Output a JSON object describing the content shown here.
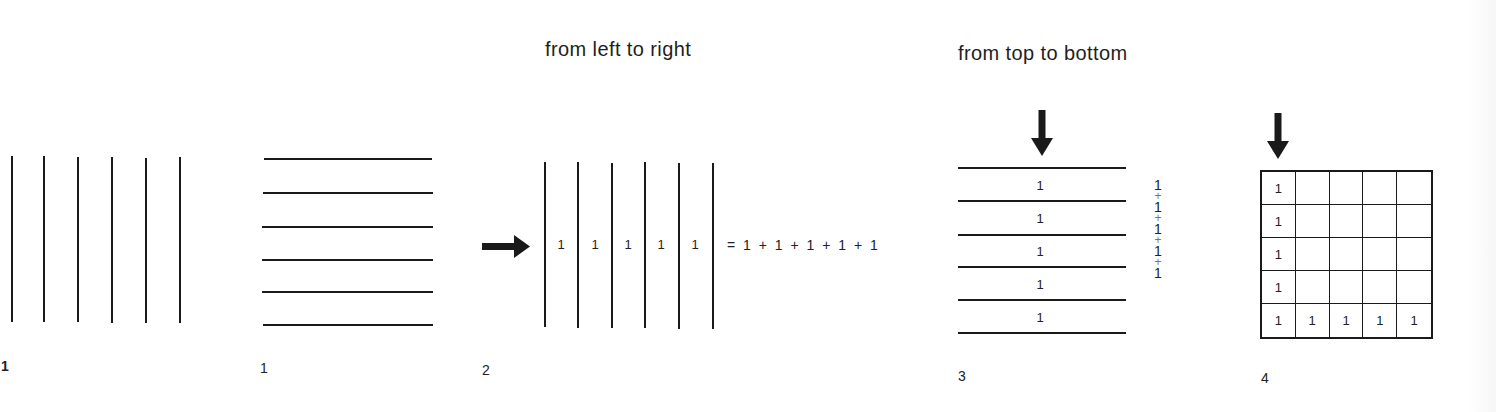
{
  "headings": {
    "left_to_right": "from left to right",
    "top_to_bottom": "from top to bottom"
  },
  "figures": [
    {
      "id": "fig1a",
      "label": "1",
      "kind": "vertical-lines",
      "line_count": 6
    },
    {
      "id": "fig1b",
      "label": "1",
      "kind": "horizontal-lines",
      "line_count": 6
    },
    {
      "id": "fig2",
      "label": "2",
      "kind": "vertical-strips-counted-left-to-right",
      "arrow": "right-arrow",
      "strip_values": [
        "1",
        "1",
        "1",
        "1",
        "1"
      ],
      "equation": "= 1 + 1 + 1 + 1 + 1"
    },
    {
      "id": "fig3",
      "label": "3",
      "kind": "horizontal-strips-counted-top-to-bottom",
      "arrow": "down-arrow",
      "strip_values": [
        "1",
        "1",
        "1",
        "1",
        "1"
      ],
      "side_sum": [
        "1",
        "+",
        "1",
        "+",
        "1",
        "+",
        "1",
        "+",
        "1"
      ]
    },
    {
      "id": "fig4",
      "label": "4",
      "kind": "grid-5x5",
      "arrow": "down-arrow",
      "rows": [
        [
          "1",
          "",
          "",
          "",
          ""
        ],
        [
          "1",
          "",
          "",
          "",
          ""
        ],
        [
          "1",
          "",
          "",
          "",
          ""
        ],
        [
          "1",
          "",
          "",
          "",
          ""
        ],
        [
          "1",
          "1",
          "1",
          "1",
          "1"
        ]
      ]
    }
  ]
}
